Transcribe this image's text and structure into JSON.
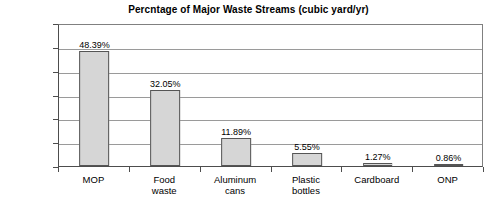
{
  "chart_data": {
    "type": "bar",
    "title": "Percntage of Major Waste Streams (cubic yard/yr)",
    "xlabel": "",
    "ylabel": "",
    "categories": [
      "MOP",
      "Food waste",
      "Aluminum cans",
      "Plastic bottles",
      "Cardboard",
      "ONP"
    ],
    "category_lines": [
      [
        "MOP"
      ],
      [
        "Food",
        "waste"
      ],
      [
        "Aluminum",
        "cans"
      ],
      [
        "Plastic",
        "bottles"
      ],
      [
        "Cardboard"
      ],
      [
        "ONP"
      ]
    ],
    "values": [
      48.39,
      32.05,
      11.89,
      5.55,
      1.27,
      0.86
    ],
    "value_labels": [
      "48.39%",
      "32.05%",
      "11.89%",
      "5.55%",
      "1.27%",
      "0.86%"
    ],
    "ylim": [
      0,
      60
    ],
    "ytick_values": [
      0,
      10,
      20,
      30,
      40,
      50,
      60
    ],
    "ytick_labels": [
      "0.00%",
      "10.00%",
      "20.00%",
      "30.00%",
      "40.00%",
      "50.00%",
      "60.00%"
    ],
    "grid": true,
    "legend": false,
    "legend_position": "none",
    "bar_fill_color": "#d6d6d6",
    "bar_border_color": "#555555",
    "gridline_color": "#9a9a9a",
    "axis_color": "#4d4d4d",
    "background_color": "#ffffff",
    "text_color": "#000000"
  }
}
